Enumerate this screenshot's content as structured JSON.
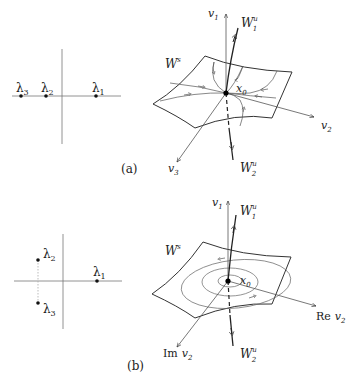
{
  "panels": [
    {
      "id": "a",
      "caption": "(a)",
      "eigen_plane": {
        "eigenvalues": [
          {
            "label": "λ",
            "sub": "3"
          },
          {
            "label": "λ",
            "sub": "2"
          },
          {
            "label": "λ",
            "sub": "1"
          }
        ]
      },
      "phase_space": {
        "axis_labels": {
          "v1": "v",
          "v1_sub": "1",
          "v2": "v",
          "v2_sub": "2",
          "v3": "v",
          "v3_sub": "3"
        },
        "manifold_labels": {
          "Ws": "W",
          "Ws_sup": "s",
          "Wu1": "W",
          "Wu1_sup": "u",
          "Wu1_sub": "1",
          "Wu2": "W",
          "Wu2_sup": "u",
          "Wu2_sub": "2"
        },
        "fixed_point": {
          "label": "x",
          "sub": "0"
        }
      }
    },
    {
      "id": "b",
      "caption": "(b)",
      "eigen_plane": {
        "eigenvalues": [
          {
            "label": "λ",
            "sub": "2"
          },
          {
            "label": "λ",
            "sub": "1"
          },
          {
            "label": "λ",
            "sub": "3"
          }
        ]
      },
      "phase_space": {
        "axis_labels": {
          "v1": "v",
          "v1_sub": "1",
          "re_prefix": "Re",
          "re_v": "v",
          "re_sub": "2",
          "im_prefix": "Im",
          "im_v": "v",
          "im_sub": "2"
        },
        "manifold_labels": {
          "Ws": "W",
          "Ws_sup": "s",
          "Wu1": "W",
          "Wu1_sup": "u",
          "Wu1_sub": "1",
          "Wu2": "W",
          "Wu2_sup": "u",
          "Wu2_sub": "2"
        },
        "fixed_point": {
          "label": "x",
          "sub": "0"
        }
      }
    }
  ]
}
